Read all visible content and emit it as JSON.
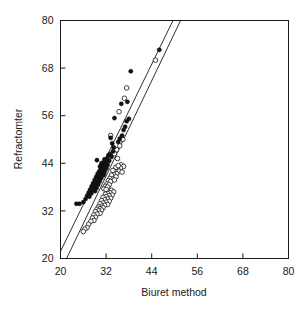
{
  "chart_data": {
    "type": "scatter",
    "title": "",
    "xlabel": "Biuret method",
    "ylabel": "Refractomter",
    "xlim": [
      20,
      80
    ],
    "ylim": [
      20,
      80
    ],
    "xticks": [
      20,
      32,
      44,
      56,
      68,
      80
    ],
    "yticks": [
      20,
      32,
      44,
      56,
      68,
      80
    ],
    "grid": false,
    "legend_position": "none",
    "series": [
      {
        "name": "filled-markers",
        "marker": "filled-circle",
        "color": "#111111",
        "points": [
          [
            46.0,
            72.6
          ],
          [
            38.5,
            67.2
          ],
          [
            37.6,
            59.5
          ],
          [
            36.0,
            59.0
          ],
          [
            34.2,
            55.4
          ],
          [
            38.0,
            55.2
          ],
          [
            37.4,
            54.6
          ],
          [
            37.0,
            53.2
          ],
          [
            36.6,
            52.4
          ],
          [
            36.2,
            51.0
          ],
          [
            35.2,
            49.4
          ],
          [
            34.0,
            48.0
          ],
          [
            33.8,
            47.0
          ],
          [
            33.0,
            46.3
          ],
          [
            32.6,
            46.0
          ],
          [
            33.4,
            45.6
          ],
          [
            32.2,
            45.2
          ],
          [
            31.6,
            45.0
          ],
          [
            32.8,
            44.6
          ],
          [
            32.0,
            44.4
          ],
          [
            31.2,
            44.2
          ],
          [
            30.8,
            44.0
          ],
          [
            31.8,
            43.8
          ],
          [
            32.4,
            43.6
          ],
          [
            31.0,
            43.4
          ],
          [
            30.4,
            43.2
          ],
          [
            31.4,
            43.0
          ],
          [
            32.1,
            42.8
          ],
          [
            30.6,
            42.6
          ],
          [
            31.1,
            42.4
          ],
          [
            31.7,
            42.2
          ],
          [
            30.2,
            42.0
          ],
          [
            30.9,
            41.8
          ],
          [
            31.5,
            41.6
          ],
          [
            29.8,
            41.4
          ],
          [
            30.5,
            41.2
          ],
          [
            31.3,
            41.0
          ],
          [
            29.4,
            40.6
          ],
          [
            30.1,
            40.4
          ],
          [
            30.7,
            40.2
          ],
          [
            29.0,
            39.8
          ],
          [
            29.7,
            39.6
          ],
          [
            30.3,
            39.4
          ],
          [
            28.6,
            39.0
          ],
          [
            29.3,
            38.8
          ],
          [
            29.9,
            38.6
          ],
          [
            28.2,
            38.2
          ],
          [
            28.9,
            38.0
          ],
          [
            29.5,
            37.8
          ],
          [
            27.8,
            37.4
          ],
          [
            28.5,
            37.2
          ],
          [
            29.1,
            37.0
          ],
          [
            27.4,
            36.6
          ],
          [
            28.1,
            36.4
          ],
          [
            27.0,
            35.8
          ],
          [
            27.6,
            35.6
          ],
          [
            26.6,
            35.0
          ],
          [
            26.0,
            34.2
          ],
          [
            25.0,
            33.8
          ],
          [
            24.2,
            33.8
          ],
          [
            33.6,
            49.0
          ],
          [
            35.6,
            50.2
          ],
          [
            29.6,
            44.8
          ],
          [
            33.2,
            50.4
          ]
        ]
      },
      {
        "name": "open-markers",
        "marker": "open-circle",
        "color": "#111111",
        "points": [
          [
            45.0,
            70.0
          ],
          [
            37.4,
            63.0
          ],
          [
            36.8,
            60.4
          ],
          [
            35.4,
            57.0
          ],
          [
            33.2,
            51.0
          ],
          [
            36.4,
            50.0
          ],
          [
            35.6,
            48.4
          ],
          [
            34.8,
            47.4
          ],
          [
            34.2,
            46.4
          ],
          [
            35.0,
            45.2
          ],
          [
            36.0,
            43.6
          ],
          [
            36.6,
            43.2
          ],
          [
            35.8,
            42.8
          ],
          [
            35.0,
            42.6
          ],
          [
            34.4,
            42.4
          ],
          [
            35.4,
            42.0
          ],
          [
            36.2,
            41.8
          ],
          [
            34.8,
            41.4
          ],
          [
            34.0,
            41.2
          ],
          [
            33.4,
            41.0
          ],
          [
            34.6,
            40.6
          ],
          [
            33.0,
            40.2
          ],
          [
            33.8,
            40.0
          ],
          [
            32.6,
            39.6
          ],
          [
            33.2,
            39.4
          ],
          [
            32.2,
            38.8
          ],
          [
            32.8,
            38.6
          ],
          [
            31.8,
            38.2
          ],
          [
            32.4,
            38.0
          ],
          [
            31.4,
            37.6
          ],
          [
            32.0,
            37.4
          ],
          [
            33.4,
            37.2
          ],
          [
            34.0,
            36.8
          ],
          [
            33.0,
            36.6
          ],
          [
            32.4,
            36.4
          ],
          [
            31.8,
            36.2
          ],
          [
            33.6,
            36.0
          ],
          [
            32.8,
            35.8
          ],
          [
            32.0,
            35.6
          ],
          [
            31.2,
            35.4
          ],
          [
            33.2,
            35.2
          ],
          [
            32.4,
            35.0
          ],
          [
            31.6,
            34.8
          ],
          [
            30.8,
            34.6
          ],
          [
            32.8,
            34.4
          ],
          [
            32.0,
            34.2
          ],
          [
            31.2,
            34.0
          ],
          [
            30.4,
            33.8
          ],
          [
            32.4,
            33.6
          ],
          [
            31.6,
            33.4
          ],
          [
            30.8,
            33.2
          ],
          [
            30.0,
            33.0
          ],
          [
            31.2,
            32.8
          ],
          [
            30.4,
            32.6
          ],
          [
            29.6,
            32.4
          ],
          [
            30.8,
            32.2
          ],
          [
            30.0,
            32.0
          ],
          [
            29.2,
            31.8
          ],
          [
            30.4,
            31.4
          ],
          [
            29.6,
            31.2
          ],
          [
            28.8,
            31.0
          ],
          [
            29.2,
            30.4
          ],
          [
            28.4,
            30.2
          ],
          [
            28.8,
            29.6
          ],
          [
            28.0,
            29.4
          ],
          [
            27.4,
            28.6
          ],
          [
            27.0,
            27.8
          ],
          [
            26.4,
            27.4
          ],
          [
            26.0,
            26.8
          ],
          [
            34.6,
            43.0
          ],
          [
            35.2,
            43.4
          ],
          [
            33.8,
            42.2
          ],
          [
            34.2,
            39.8
          ]
        ]
      }
    ],
    "fit_lines": [
      {
        "name": "upper-fit-line",
        "x1": 20.0,
        "y1": 21.8,
        "x2": 49.6,
        "y2": 80.0
      },
      {
        "name": "lower-fit-line",
        "x1": 21.6,
        "y1": 20.0,
        "x2": 51.6,
        "y2": 80.0
      }
    ]
  }
}
